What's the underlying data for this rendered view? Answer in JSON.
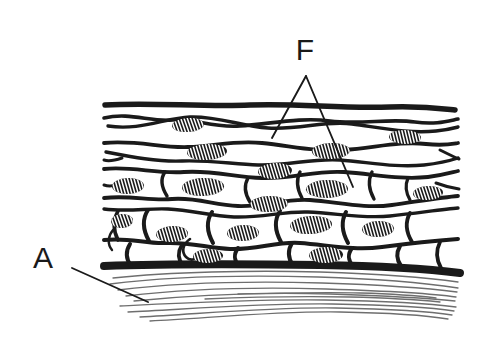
{
  "figure": {
    "background_color": "#ffffff",
    "ink_color": "#1a1a1a",
    "fiber_color": "#6e6e6e",
    "width": 485,
    "height": 338
  },
  "labels": [
    {
      "id": "label-a",
      "text": "A",
      "x": 43,
      "y": 268,
      "font_size": 30,
      "meaning": "underlying connective tissue fibers",
      "leader": {
        "from_x": 72,
        "from_y": 268,
        "to_x": 148,
        "to_y": 302
      }
    },
    {
      "id": "label-f",
      "text": "F",
      "x": 305,
      "y": 60,
      "font_size": 30,
      "meaning": "flattened squamous surface cells",
      "leader_apex_x": 306,
      "leader_apex_y": 76,
      "leaders": [
        {
          "to_x": 272,
          "to_y": 138
        },
        {
          "to_x": 353,
          "to_y": 187
        }
      ]
    }
  ],
  "tissue": {
    "left_edge": 104,
    "right_edge": 458,
    "surface_y": 104,
    "basement_membrane_y": 268,
    "basement_membrane_thickness": 7,
    "layers": [
      {
        "name": "squamous-surface-layer",
        "y": 104
      },
      {
        "name": "squamous-layer-2",
        "y": 133
      },
      {
        "name": "squamous-layer-3",
        "y": 158
      },
      {
        "name": "intermediate-layer",
        "y": 182
      },
      {
        "name": "polygonal-layer",
        "y": 212
      },
      {
        "name": "basal-layer",
        "y": 243
      }
    ]
  },
  "nuclei": [
    {
      "cx": 188,
      "cy": 125,
      "rx": 16,
      "ry": 7,
      "rot": -4
    },
    {
      "cx": 405,
      "cy": 137,
      "rx": 16,
      "ry": 7,
      "rot": 2
    },
    {
      "cx": 207,
      "cy": 152,
      "rx": 20,
      "ry": 8,
      "rot": -3
    },
    {
      "cx": 331,
      "cy": 151,
      "rx": 19,
      "ry": 8,
      "rot": -2
    },
    {
      "cx": 275,
      "cy": 171,
      "rx": 17,
      "ry": 8,
      "rot": -3
    },
    {
      "cx": 128,
      "cy": 186,
      "rx": 16,
      "ry": 8,
      "rot": -2
    },
    {
      "cx": 203,
      "cy": 187,
      "rx": 21,
      "ry": 9,
      "rot": -2
    },
    {
      "cx": 327,
      "cy": 189,
      "rx": 21,
      "ry": 9,
      "rot": -1
    },
    {
      "cx": 428,
      "cy": 193,
      "rx": 15,
      "ry": 7,
      "rot": -3
    },
    {
      "cx": 269,
      "cy": 204,
      "rx": 19,
      "ry": 8,
      "rot": -2
    },
    {
      "cx": 122,
      "cy": 221,
      "rx": 11,
      "ry": 7,
      "rot": -4
    },
    {
      "cx": 172,
      "cy": 234,
      "rx": 16,
      "ry": 8,
      "rot": -3
    },
    {
      "cx": 243,
      "cy": 233,
      "rx": 16,
      "ry": 8,
      "rot": -2
    },
    {
      "cx": 311,
      "cy": 225,
      "rx": 21,
      "ry": 9,
      "rot": -3
    },
    {
      "cx": 378,
      "cy": 229,
      "rx": 16,
      "ry": 8,
      "rot": -2
    },
    {
      "cx": 208,
      "cy": 256,
      "rx": 15,
      "ry": 7,
      "rot": -2
    },
    {
      "cx": 326,
      "cy": 255,
      "rx": 17,
      "ry": 8,
      "rot": -2
    }
  ],
  "connective_fibers_count": 11
}
